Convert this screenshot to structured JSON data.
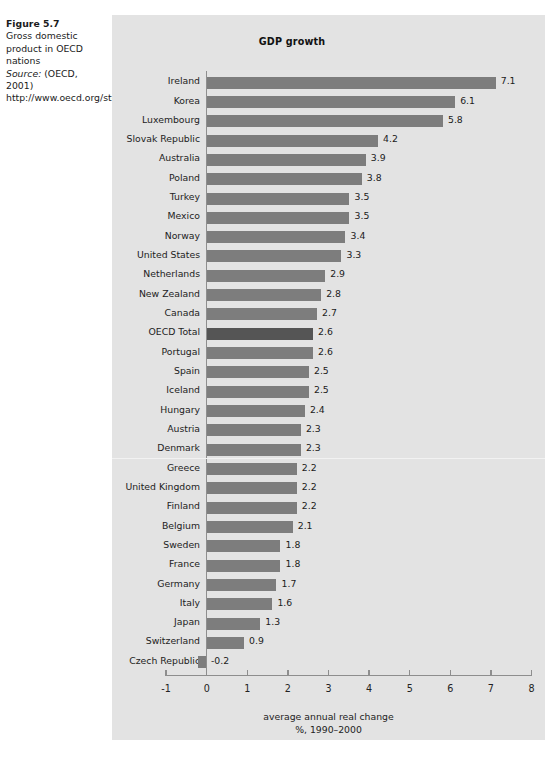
{
  "figure": {
    "number": "Figure 5.7",
    "description": "Gross domestic product in OECD nations",
    "source_word": "Source:",
    "source_text": " (OECD, 2001) http://www.oecd.org/std/nahome.htm"
  },
  "chart_data": {
    "type": "bar",
    "orientation": "horizontal",
    "title": "GDP growth",
    "xlabel_line1": "average annual real change",
    "xlabel_line2": "%, 1990–2000",
    "ylabel": "",
    "xlim": [
      -1,
      8
    ],
    "xticks": [
      -1,
      0,
      1,
      2,
      3,
      4,
      5,
      6,
      7,
      8
    ],
    "xtick_labels": [
      "-1",
      "0",
      "1",
      "2",
      "3",
      "4",
      "5",
      "6",
      "7",
      "8"
    ],
    "grid": false,
    "legend": false,
    "bar_color": "#7d7d7d",
    "highlight_color": "#555555",
    "highlight_category": "OECD Total",
    "panel_background": "#e3e3e3",
    "divider_after": "Denmark",
    "categories": [
      "Ireland",
      "Korea",
      "Luxembourg",
      "Slovak Republic",
      "Australia",
      "Poland",
      "Turkey",
      "Mexico",
      "Norway",
      "United States",
      "Netherlands",
      "New Zealand",
      "Canada",
      "OECD Total",
      "Portugal",
      "Spain",
      "Iceland",
      "Hungary",
      "Austria",
      "Denmark",
      "Greece",
      "United Kingdom",
      "Finland",
      "Belgium",
      "Sweden",
      "France",
      "Germany",
      "Italy",
      "Japan",
      "Switzerland",
      "Czech Republic"
    ],
    "values": [
      7.1,
      6.1,
      5.8,
      4.2,
      3.9,
      3.8,
      3.5,
      3.5,
      3.4,
      3.3,
      2.9,
      2.8,
      2.7,
      2.6,
      2.6,
      2.5,
      2.5,
      2.4,
      2.3,
      2.3,
      2.2,
      2.2,
      2.2,
      2.1,
      1.8,
      1.8,
      1.7,
      1.6,
      1.3,
      0.9,
      -0.2
    ],
    "value_labels": [
      "7.1",
      "6.1",
      "5.8",
      "4.2",
      "3.9",
      "3.8",
      "3.5",
      "3.5",
      "3.4",
      "3.3",
      "2.9",
      "2.8",
      "2.7",
      "2.6",
      "2.6",
      "2.5",
      "2.5",
      "2.4",
      "2.3",
      "2.3",
      "2.2",
      "2.2",
      "2.2",
      "2.1",
      "1.8",
      "1.8",
      "1.7",
      "1.6",
      "1.3",
      "0.9",
      "-0.2"
    ]
  }
}
